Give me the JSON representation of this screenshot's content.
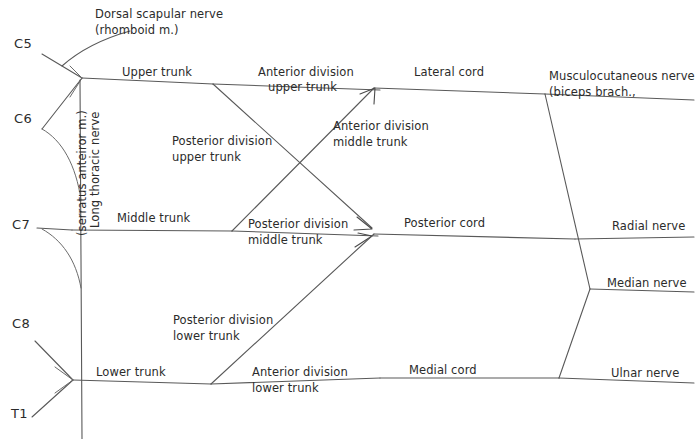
{
  "diagram": {
    "background_color": "#ffffff",
    "line_color": "#595959",
    "text_color": "#2b2b2b",
    "width": 696,
    "height": 439
  },
  "roots": [
    {
      "id": "c5",
      "label": "C5"
    },
    {
      "id": "c6",
      "label": "C6"
    },
    {
      "id": "c7",
      "label": "C7"
    },
    {
      "id": "c8",
      "label": "C8"
    },
    {
      "id": "t1",
      "label": "T1"
    }
  ],
  "branch_labels": {
    "dorsal_scapular_line1": "Dorsal scapular nerve",
    "dorsal_scapular_line2": "(rhomboid m.)",
    "long_thoracic_line1": "Long thoracic nerve",
    "long_thoracic_line2": "(serratus anteiror m.)"
  },
  "trunks": [
    {
      "id": "upper-trunk",
      "label": "Upper trunk"
    },
    {
      "id": "middle-trunk",
      "label": "Middle trunk"
    },
    {
      "id": "lower-trunk",
      "label": "Lower trunk"
    }
  ],
  "divisions": [
    {
      "id": "anterior-upper",
      "line1": "Anterior division",
      "line2": "upper trunk"
    },
    {
      "id": "posterior-upper",
      "line1": "Posterior division",
      "line2": "upper trunk"
    },
    {
      "id": "anterior-middle",
      "line1": "Anterior division",
      "line2": "middle trunk"
    },
    {
      "id": "posterior-middle",
      "line1": "Posterior division",
      "line2": "middle trunk"
    },
    {
      "id": "posterior-lower",
      "line1": "Posterior division",
      "line2": "lower trunk"
    },
    {
      "id": "anterior-lower",
      "line1": "Anterior division",
      "line2": "lower trunk"
    }
  ],
  "cords": [
    {
      "id": "lateral-cord",
      "label": "Lateral cord"
    },
    {
      "id": "posterior-cord",
      "label": "Posterior cord"
    },
    {
      "id": "medial-cord",
      "label": "Medial cord"
    }
  ],
  "terminal_nerves": [
    {
      "id": "musculocutaneous",
      "line1": "Musculocutaneous nerve",
      "line2": "(biceps brach.,"
    },
    {
      "id": "radial",
      "label": "Radial nerve"
    },
    {
      "id": "median",
      "label": "Median nerve"
    },
    {
      "id": "ulnar",
      "label": "Ulnar nerve"
    }
  ]
}
